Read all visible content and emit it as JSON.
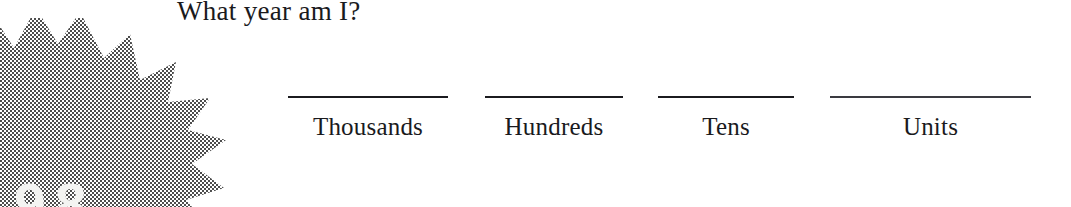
{
  "worksheet": {
    "heading": "What year am I?",
    "graphic": {
      "icon": "starburst-shape",
      "digits": "98",
      "fill_color": "#808080"
    },
    "columns": [
      {
        "id": "thousands",
        "label": "Thousands",
        "value": ""
      },
      {
        "id": "hundreds",
        "label": "Hundreds",
        "value": ""
      },
      {
        "id": "tens",
        "label": "Tens",
        "value": ""
      },
      {
        "id": "units",
        "label": "Units",
        "value": ""
      }
    ]
  },
  "colors": {
    "background": "#ffffff",
    "ink": "#1a1a1d",
    "rule": "#1b1b1f",
    "halftone_gray": "#808080"
  }
}
